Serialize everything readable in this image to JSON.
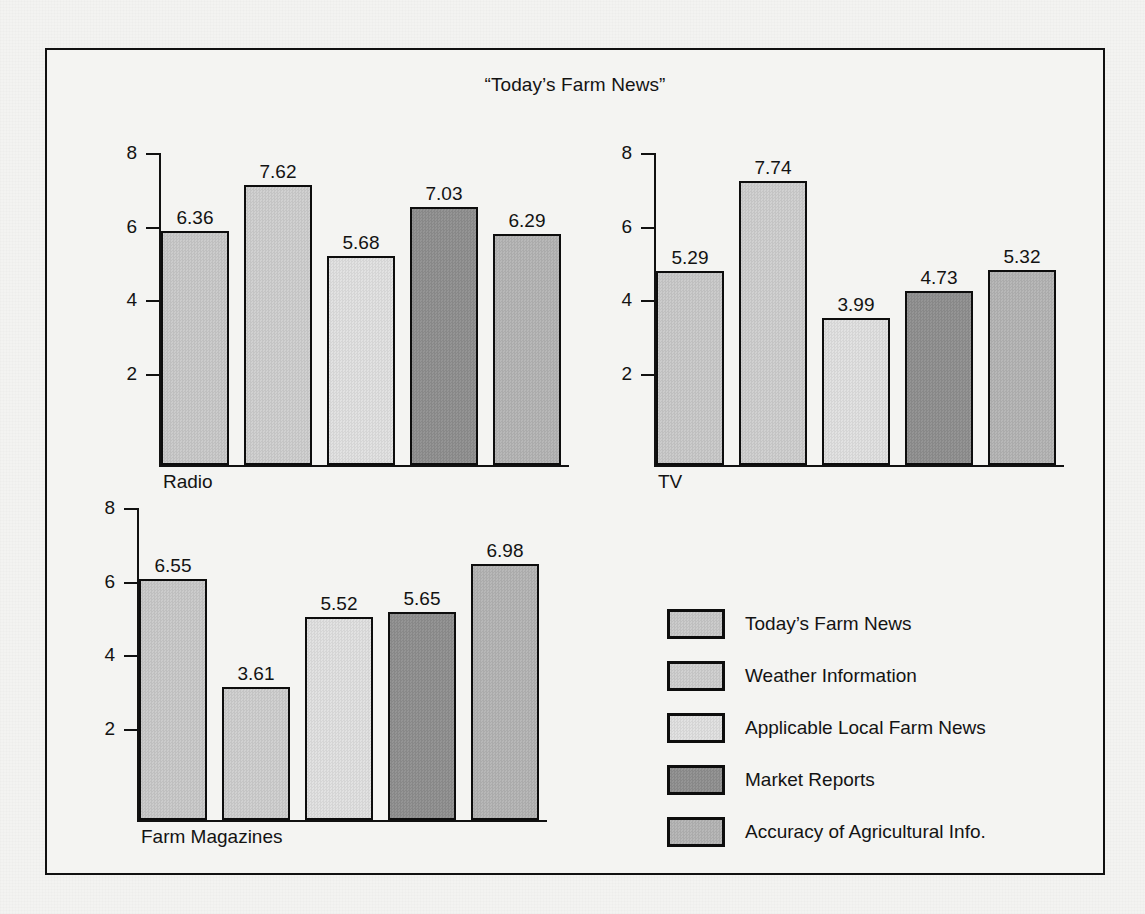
{
  "figure": {
    "title": "“Today’s Farm News”",
    "background_color": "#f3f3f1",
    "frame_color": "#111111"
  },
  "chart_data": {
    "type": "bar",
    "title": "“Today’s Farm News”",
    "xlabel": "",
    "ylabel": "",
    "ylim": [
      0,
      8.6
    ],
    "ytick_labels": [
      "2",
      "4",
      "6",
      "8"
    ],
    "ytick_values": [
      2,
      4,
      6,
      8
    ],
    "grid": false,
    "legend_position": "bottom-right",
    "categories": [
      "Today’s Farm News",
      "Weather Information",
      "Applicable Local Farm News",
      "Market Reports",
      "Accuracy of Agricultural Info."
    ],
    "category_colors": [
      "#c9c9c9",
      "#cfcfcf",
      "#e0e0e0",
      "#8f8f8f",
      "#b4b4b4"
    ],
    "panels": [
      {
        "name": "Radio",
        "label": "Radio",
        "values": [
          6.36,
          7.62,
          5.68,
          7.03,
          6.29
        ],
        "value_labels": [
          "6.36",
          "7.62",
          "5.68",
          "7.03",
          "6.29"
        ]
      },
      {
        "name": "TV",
        "label": "TV",
        "values": [
          5.29,
          7.74,
          3.99,
          4.73,
          5.32
        ],
        "value_labels": [
          "5.29",
          "7.74",
          "3.99",
          "4.73",
          "5.32"
        ]
      },
      {
        "name": "Farm Magazines",
        "label": "Farm Magazines",
        "values": [
          6.55,
          3.61,
          5.52,
          5.65,
          6.98
        ],
        "value_labels": [
          "6.55",
          "3.61",
          "5.52",
          "5.65",
          "6.98"
        ]
      }
    ]
  },
  "legend": {
    "items": [
      {
        "label": "Today’s Farm News",
        "color": "#c9c9c9"
      },
      {
        "label": "Weather Information",
        "color": "#cfcfcf"
      },
      {
        "label": "Applicable Local Farm News",
        "color": "#e0e0e0"
      },
      {
        "label": "Market Reports",
        "color": "#8f8f8f"
      },
      {
        "label": "Accuracy of Agricultural Info.",
        "color": "#b4b4b4"
      }
    ]
  }
}
